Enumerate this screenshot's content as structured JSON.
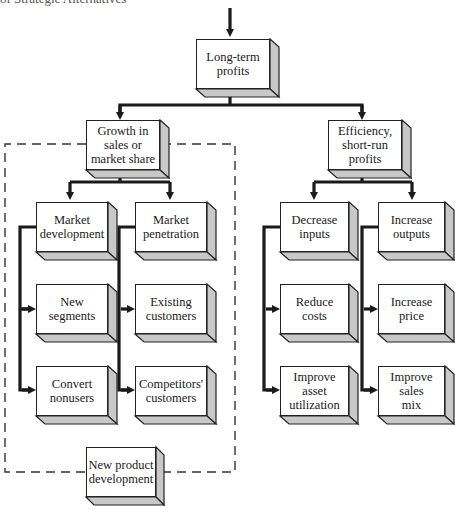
{
  "caption": "of Strategic Alternatives",
  "colors": {
    "line": "#1a1a1a",
    "box_side": "#c8c8c8",
    "dash": "#333333"
  },
  "nodes": {
    "root": "Long-term\nprofits",
    "growth": "Growth in\nsales or\nmarket share",
    "efficiency": "Efficiency,\nshort-run\nprofits",
    "market_development": "Market\ndevelopment",
    "market_penetration": "Market\npenetration",
    "new_segments": "New\nsegments",
    "existing_customers": "Existing\ncustomers",
    "convert_nonusers": "Convert\nnonusers",
    "competitors_customers": "Competitors'\ncustomers",
    "decrease_inputs": "Decrease\ninputs",
    "increase_outputs": "Increase\noutputs",
    "reduce_costs": "Reduce\ncosts",
    "increase_price": "Increase\nprice",
    "improve_asset_utilization": "Improve\nasset\nutilization",
    "improve_sales_mix": "Improve\nsales\nmix",
    "new_product_development": "New product\ndevelopment"
  },
  "edges": [
    [
      "root",
      "growth"
    ],
    [
      "root",
      "efficiency"
    ],
    [
      "growth",
      "market_development"
    ],
    [
      "growth",
      "market_penetration"
    ],
    [
      "market_development",
      "new_segments"
    ],
    [
      "market_development",
      "convert_nonusers"
    ],
    [
      "market_penetration",
      "existing_customers"
    ],
    [
      "market_penetration",
      "competitors_customers"
    ],
    [
      "efficiency",
      "decrease_inputs"
    ],
    [
      "efficiency",
      "increase_outputs"
    ],
    [
      "decrease_inputs",
      "reduce_costs"
    ],
    [
      "decrease_inputs",
      "improve_asset_utilization"
    ],
    [
      "increase_outputs",
      "increase_price"
    ],
    [
      "increase_outputs",
      "improve_sales_mix"
    ]
  ],
  "groups": [
    {
      "name": "growth-strategies",
      "style": "dashed",
      "contains": [
        "growth",
        "market_development",
        "market_penetration",
        "new_segments",
        "existing_customers",
        "convert_nonusers",
        "competitors_customers",
        "new_product_development"
      ]
    }
  ]
}
